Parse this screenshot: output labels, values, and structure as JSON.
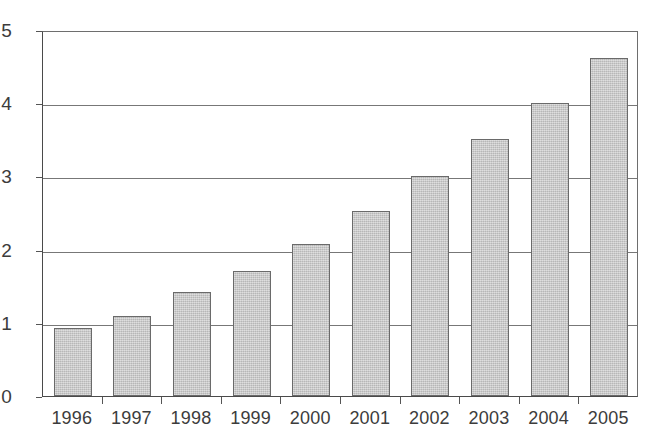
{
  "chart_data": {
    "type": "bar",
    "title": "",
    "subtitle": "",
    "xlabel": "",
    "ylabel": "",
    "categories": [
      "1996",
      "1997",
      "1998",
      "1999",
      "2000",
      "2001",
      "2002",
      "2003",
      "2004",
      "2005"
    ],
    "values": [
      0.93,
      1.09,
      1.42,
      1.71,
      2.07,
      2.53,
      3.0,
      3.51,
      4.0,
      4.62
    ],
    "series": [
      {
        "name": "",
        "values": [
          0.93,
          1.09,
          1.42,
          1.71,
          2.07,
          2.53,
          3.0,
          3.51,
          4.0,
          4.62
        ]
      }
    ],
    "ylim": [
      0,
      5
    ],
    "y_ticks": [
      0,
      1,
      2,
      3,
      4,
      5
    ],
    "y_tick_labels": [
      "0",
      "1",
      "2",
      "3",
      "4",
      "5"
    ],
    "grid": "horizontal",
    "legend": "none",
    "annotations": [],
    "colors": {
      "bar_fill": "#c3c3c3",
      "bar_border": "#6a6a6a",
      "gridline": "#777777",
      "axis": "#4a4a4a",
      "text": "#3c3c3c",
      "background": "#ffffff"
    }
  }
}
